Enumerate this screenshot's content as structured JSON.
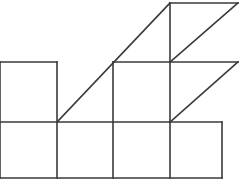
{
  "figure": {
    "type": "line-drawing",
    "background_color": "#ffffff",
    "stroke_color": "#3a3a3a",
    "stroke_width": 1.6,
    "canvas": {
      "width": 241,
      "height": 188
    },
    "grid": {
      "unit_size": 57,
      "x_coords": [
        0,
        57,
        113,
        170,
        222,
        238
      ],
      "y_coords": [
        3,
        62,
        122,
        178
      ],
      "note": "left column is cropped by the image edge at x=0"
    },
    "cells": [
      {
        "name": "bottom-row-cell-1",
        "x0": 0,
        "y0": 122,
        "x1": 57,
        "y1": 178
      },
      {
        "name": "bottom-row-cell-2",
        "x0": 57,
        "y0": 122,
        "x1": 113,
        "y1": 178
      },
      {
        "name": "bottom-row-cell-3",
        "x0": 113,
        "y0": 122,
        "x1": 170,
        "y1": 178
      },
      {
        "name": "bottom-row-cell-4",
        "x0": 170,
        "y0": 122,
        "x1": 222,
        "y1": 178
      },
      {
        "name": "middle-row-cell-1",
        "x0": 0,
        "y0": 62,
        "x1": 57,
        "y1": 122
      },
      {
        "name": "middle-row-cell-3",
        "x0": 113,
        "y0": 62,
        "x1": 170,
        "y1": 122
      },
      {
        "name": "middle-row-cell-4",
        "x0": 170,
        "y0": 62,
        "x1": 238,
        "y1": 122
      },
      {
        "name": "top-row-cell-4",
        "x0": 170,
        "y0": 3,
        "x1": 238,
        "y1": 62
      }
    ],
    "segments": [
      {
        "name": "bottom-edge",
        "x1": 0,
        "y1": 178,
        "x2": 222,
        "y2": 178,
        "orientation": "horizontal"
      },
      {
        "name": "middle-horizontal-edge",
        "x1": 0,
        "y1": 122,
        "x2": 222,
        "y2": 122,
        "orientation": "horizontal"
      },
      {
        "name": "upper-horizontal-edge",
        "x1": 0,
        "y1": 62,
        "x2": 57,
        "y2": 62,
        "orientation": "horizontal"
      },
      {
        "name": "upper-horizontal-edge-right",
        "x1": 113,
        "y1": 62,
        "x2": 238,
        "y2": 62,
        "orientation": "horizontal"
      },
      {
        "name": "top-edge",
        "x1": 170,
        "y1": 3,
        "x2": 238,
        "y2": 3,
        "orientation": "horizontal"
      },
      {
        "name": "vertical-left-edge",
        "x1": 0,
        "y1": 62,
        "x2": 0,
        "y2": 178,
        "orientation": "vertical"
      },
      {
        "name": "vertical-x57",
        "x1": 57,
        "y1": 62,
        "x2": 57,
        "y2": 178,
        "orientation": "vertical"
      },
      {
        "name": "vertical-x113",
        "x1": 113,
        "y1": 62,
        "x2": 113,
        "y2": 178,
        "orientation": "vertical"
      },
      {
        "name": "vertical-x170",
        "x1": 170,
        "y1": 3,
        "x2": 170,
        "y2": 178,
        "orientation": "vertical"
      },
      {
        "name": "vertical-right-edge",
        "x1": 222,
        "y1": 122,
        "x2": 222,
        "y2": 178,
        "orientation": "vertical"
      }
    ],
    "diagonals": [
      {
        "name": "long-staircase-diagonal",
        "x1": 57,
        "y1": 122,
        "x2": 170,
        "y2": 3,
        "direction": "up-right",
        "spans_cells": 2
      },
      {
        "name": "middle-cell-diagonal",
        "x1": 170,
        "y1": 122,
        "x2": 238,
        "y2": 62,
        "direction": "up-right",
        "spans_cells": 1
      },
      {
        "name": "top-cell-diagonal",
        "x1": 170,
        "y1": 62,
        "x2": 238,
        "y2": 3,
        "direction": "up-right",
        "spans_cells": 1
      }
    ]
  }
}
